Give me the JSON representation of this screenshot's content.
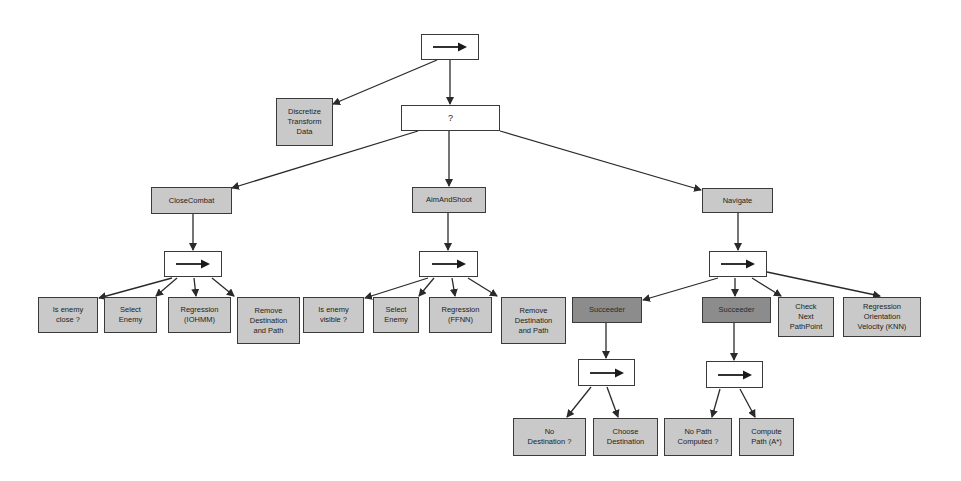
{
  "diagram": {
    "type": "behavior-tree",
    "colors": {
      "leaf_fill": "#c9c9c9",
      "decorator_fill": "#8c8c8c",
      "composite_fill": "#ffffff",
      "stroke": "#3a3a3a"
    },
    "nodes": [
      {
        "id": "root",
        "kind": "sequence",
        "label": "→",
        "x": 421,
        "y": 34,
        "w": 58,
        "h": 26
      },
      {
        "id": "discretize",
        "kind": "leaf",
        "label": "Discretize\nTransform\nData",
        "x": 276,
        "y": 98,
        "w": 57,
        "h": 48
      },
      {
        "id": "selector",
        "kind": "selector",
        "label": "?",
        "x": 401,
        "y": 105,
        "w": 99,
        "h": 26
      },
      {
        "id": "closecombat",
        "kind": "leaf",
        "label": "CloseCombat",
        "x": 151,
        "y": 187,
        "w": 81,
        "h": 27
      },
      {
        "id": "aimandshoot",
        "kind": "leaf",
        "label": "AimAndShoot",
        "x": 412,
        "y": 187,
        "w": 74,
        "h": 26
      },
      {
        "id": "navigate",
        "kind": "leaf",
        "label": "Navigate",
        "x": 702,
        "y": 188,
        "w": 71,
        "h": 25
      },
      {
        "id": "cc_seq",
        "kind": "sequence",
        "label": "→",
        "x": 164,
        "y": 251,
        "w": 58,
        "h": 26
      },
      {
        "id": "as_seq",
        "kind": "sequence",
        "label": "→",
        "x": 419,
        "y": 251,
        "w": 59,
        "h": 26
      },
      {
        "id": "nav_seq",
        "kind": "sequence",
        "label": "→",
        "x": 709,
        "y": 251,
        "w": 58,
        "h": 26
      },
      {
        "id": "cc_close",
        "kind": "leaf",
        "label": "Is enemy\nclose ?",
        "x": 38,
        "y": 297,
        "w": 60,
        "h": 36
      },
      {
        "id": "cc_select",
        "kind": "leaf",
        "label": "Select\nEnemy",
        "x": 104,
        "y": 297,
        "w": 53,
        "h": 36
      },
      {
        "id": "cc_regr",
        "kind": "leaf",
        "label": "Regression\n(IOHMM)",
        "x": 168,
        "y": 297,
        "w": 63,
        "h": 36
      },
      {
        "id": "cc_remove",
        "kind": "leaf",
        "label": "Remove\nDestination\nand Path",
        "x": 237,
        "y": 297,
        "w": 63,
        "h": 47
      },
      {
        "id": "as_visible",
        "kind": "leaf",
        "label": "Is enemy\nvisible ?",
        "x": 303,
        "y": 297,
        "w": 61,
        "h": 36
      },
      {
        "id": "as_select",
        "kind": "leaf",
        "label": "Select\nEnemy",
        "x": 373,
        "y": 297,
        "w": 46,
        "h": 36
      },
      {
        "id": "as_regr",
        "kind": "leaf",
        "label": "Regression\n(FFNN)",
        "x": 429,
        "y": 297,
        "w": 63,
        "h": 36
      },
      {
        "id": "as_remove",
        "kind": "leaf",
        "label": "Remove\nDestination\nand Path",
        "x": 501,
        "y": 297,
        "w": 65,
        "h": 47
      },
      {
        "id": "succ1",
        "kind": "decorator",
        "label": "Succeeder",
        "x": 572,
        "y": 297,
        "w": 70,
        "h": 26
      },
      {
        "id": "succ2",
        "kind": "decorator",
        "label": "Succeeder",
        "x": 702,
        "y": 297,
        "w": 69,
        "h": 26
      },
      {
        "id": "nav_check",
        "kind": "leaf",
        "label": "Check\nNext\nPathPoint",
        "x": 778,
        "y": 297,
        "w": 56,
        "h": 40
      },
      {
        "id": "nav_regr",
        "kind": "leaf",
        "label": "Regression\nOrientation\nVelocity (KNN)",
        "x": 843,
        "y": 297,
        "w": 78,
        "h": 40
      },
      {
        "id": "s1_seq",
        "kind": "sequence",
        "label": "→",
        "x": 578,
        "y": 359,
        "w": 57,
        "h": 27
      },
      {
        "id": "s2_seq",
        "kind": "sequence",
        "label": "→",
        "x": 706,
        "y": 361,
        "w": 57,
        "h": 27
      },
      {
        "id": "no_dest",
        "kind": "leaf",
        "label": "No\nDestination ?",
        "x": 513,
        "y": 418,
        "w": 73,
        "h": 38
      },
      {
        "id": "choose_dest",
        "kind": "leaf",
        "label": "Choose\nDestination",
        "x": 593,
        "y": 418,
        "w": 65,
        "h": 38
      },
      {
        "id": "no_path",
        "kind": "leaf",
        "label": "No Path\nComputed ?",
        "x": 664,
        "y": 418,
        "w": 68,
        "h": 38
      },
      {
        "id": "compute_path",
        "kind": "leaf",
        "label": "Compute\nPath (A*)",
        "x": 739,
        "y": 418,
        "w": 55,
        "h": 38
      }
    ],
    "edges": [
      {
        "from": "root",
        "to": "discretize",
        "x1": 437,
        "y1": 60,
        "x2": 333,
        "y2": 104
      },
      {
        "from": "root",
        "to": "selector",
        "x1": 450,
        "y1": 60,
        "x2": 450,
        "y2": 104
      },
      {
        "from": "selector",
        "to": "closecombat",
        "x1": 418,
        "y1": 131,
        "x2": 232,
        "y2": 188
      },
      {
        "from": "selector",
        "to": "aimandshoot",
        "x1": 449,
        "y1": 131,
        "x2": 449,
        "y2": 186
      },
      {
        "from": "selector",
        "to": "navigate",
        "x1": 500,
        "y1": 131,
        "x2": 701,
        "y2": 190
      },
      {
        "from": "closecombat",
        "to": "cc_seq",
        "x1": 193,
        "y1": 214,
        "x2": 193,
        "y2": 250
      },
      {
        "from": "aimandshoot",
        "to": "as_seq",
        "x1": 448,
        "y1": 213,
        "x2": 448,
        "y2": 250
      },
      {
        "from": "navigate",
        "to": "nav_seq",
        "x1": 738,
        "y1": 213,
        "x2": 738,
        "y2": 250
      },
      {
        "from": "cc_seq",
        "to": "cc_close",
        "x1": 172,
        "y1": 278,
        "x2": 99,
        "y2": 298
      },
      {
        "from": "cc_seq",
        "to": "cc_select",
        "x1": 177,
        "y1": 278,
        "x2": 156,
        "y2": 296
      },
      {
        "from": "cc_seq",
        "to": "cc_regr",
        "x1": 194,
        "y1": 278,
        "x2": 196,
        "y2": 296
      },
      {
        "from": "cc_seq",
        "to": "cc_remove",
        "x1": 212,
        "y1": 278,
        "x2": 234,
        "y2": 296
      },
      {
        "from": "as_seq",
        "to": "as_close",
        "x1": 428,
        "y1": 278,
        "x2": 365,
        "y2": 298
      },
      {
        "from": "as_seq",
        "to": "as_select",
        "x1": 434,
        "y1": 278,
        "x2": 419,
        "y2": 296
      },
      {
        "from": "as_seq",
        "to": "as_regr",
        "x1": 452,
        "y1": 278,
        "x2": 455,
        "y2": 296
      },
      {
        "from": "as_seq",
        "to": "as_remove",
        "x1": 468,
        "y1": 278,
        "x2": 497,
        "y2": 296
      },
      {
        "from": "nav_seq",
        "to": "succ1",
        "x1": 718,
        "y1": 278,
        "x2": 643,
        "y2": 300
      },
      {
        "from": "nav_seq",
        "to": "succ2",
        "x1": 735,
        "y1": 278,
        "x2": 735,
        "y2": 296
      },
      {
        "from": "nav_seq",
        "to": "nav_check",
        "x1": 752,
        "y1": 278,
        "x2": 781,
        "y2": 296
      },
      {
        "from": "nav_seq",
        "to": "nav_regr",
        "x1": 767,
        "y1": 272,
        "x2": 880,
        "y2": 296
      },
      {
        "from": "succ1",
        "to": "s1_seq",
        "x1": 606,
        "y1": 323,
        "x2": 606,
        "y2": 358
      },
      {
        "from": "succ2",
        "to": "s2_seq",
        "x1": 734,
        "y1": 323,
        "x2": 734,
        "y2": 360
      },
      {
        "from": "s1_seq",
        "to": "no_dest",
        "x1": 591,
        "y1": 387,
        "x2": 567,
        "y2": 417
      },
      {
        "from": "s1_seq",
        "to": "choose_dest",
        "x1": 607,
        "y1": 387,
        "x2": 618,
        "y2": 417
      },
      {
        "from": "s2_seq",
        "to": "no_path",
        "x1": 720,
        "y1": 389,
        "x2": 712,
        "y2": 417
      },
      {
        "from": "s2_seq",
        "to": "compute_path",
        "x1": 740,
        "y1": 389,
        "x2": 755,
        "y2": 417
      }
    ]
  }
}
